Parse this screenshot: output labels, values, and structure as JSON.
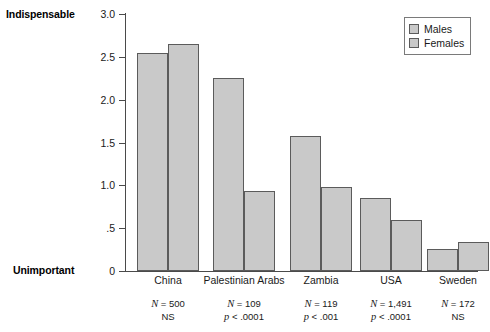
{
  "chart_data": {
    "type": "bar",
    "title": "",
    "xlabel": "",
    "ylabel": "",
    "ylim": [
      0,
      3.0
    ],
    "y_ticks": [
      "0",
      ".5",
      "1.0",
      "1.5",
      "2.0",
      "2.5",
      "3.0"
    ],
    "y_tick_values": [
      0,
      0.5,
      1.0,
      1.5,
      2.0,
      2.5,
      3.0
    ],
    "axis_top_label": "Indispensable",
    "axis_bottom_label": "Unimportant",
    "grid": false,
    "legend_position": "top-right",
    "categories": [
      "China",
      "Palestinian Arabs",
      "Zambia",
      "USA",
      "Sweden"
    ],
    "series": [
      {
        "name": "Males",
        "values": [
          2.55,
          2.25,
          1.58,
          0.85,
          0.26
        ]
      },
      {
        "name": "Females",
        "values": [
          2.65,
          0.93,
          0.98,
          0.59,
          0.34
        ]
      }
    ],
    "annotations": [
      {
        "category": "China",
        "n": "N = 500",
        "significance": "NS"
      },
      {
        "category": "Palestinian Arabs",
        "n": "N = 109",
        "significance": "p < .0001"
      },
      {
        "category": "Zambia",
        "n": "N = 119",
        "significance": "p < .001"
      },
      {
        "category": "USA",
        "n": "N = 1,491",
        "significance": "p < .0001"
      },
      {
        "category": "Sweden",
        "n": "N = 172",
        "significance": "NS"
      }
    ],
    "bar_fill_color": "#c9c9c9",
    "bar_border_color": "#5b5b5b",
    "axis_color": "#4a4a4a"
  },
  "legend": {
    "entries": [
      {
        "label": "Males"
      },
      {
        "label": "Females"
      }
    ]
  },
  "stats_rows": [
    {
      "n": "N = 500",
      "p": "NS"
    },
    {
      "n": "N = 109",
      "p": "p < .0001"
    },
    {
      "n": "N = 119",
      "p": "p < .001"
    },
    {
      "n": "N = 1,491",
      "p": "p < .0001"
    },
    {
      "n": "N = 172",
      "p": "NS"
    }
  ]
}
